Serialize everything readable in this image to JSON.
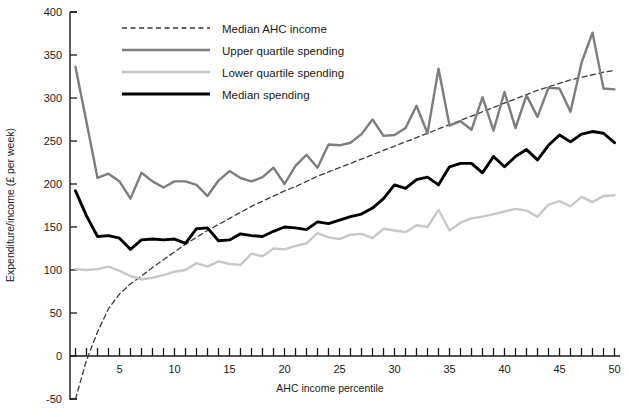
{
  "chart_data": {
    "type": "line",
    "title": "",
    "xlabel": "AHC income percentile",
    "ylabel": "Expenditure/income (£ per week)",
    "xlim": [
      0.5,
      50.5
    ],
    "ylim": [
      -50,
      400
    ],
    "xticks": [
      5,
      10,
      15,
      20,
      25,
      30,
      35,
      40,
      45,
      50
    ],
    "yticks": [
      -50,
      0,
      50,
      100,
      150,
      200,
      250,
      300,
      350,
      400
    ],
    "xtick_labels": [
      "5",
      "10",
      "15",
      "20",
      "25",
      "30",
      "35",
      "40",
      "45",
      "50"
    ],
    "ytick_labels": [
      "-50",
      "0",
      "50",
      "100",
      "150",
      "200",
      "250",
      "300",
      "350",
      "400"
    ],
    "grid": false,
    "legend_position": "top-center",
    "x": [
      1,
      2,
      3,
      4,
      5,
      6,
      7,
      8,
      9,
      10,
      11,
      12,
      13,
      14,
      15,
      16,
      17,
      18,
      19,
      20,
      21,
      22,
      23,
      24,
      25,
      26,
      27,
      28,
      29,
      30,
      31,
      32,
      33,
      34,
      35,
      36,
      37,
      38,
      39,
      40,
      41,
      42,
      43,
      44,
      45,
      46,
      47,
      48,
      49,
      50
    ],
    "series": [
      {
        "name": "Median AHC income",
        "color": "#3a3a3a",
        "style": "dashed",
        "width": 1.3,
        "values": [
          -50,
          -5,
          28,
          55,
          72,
          84,
          93,
          103,
          112,
          121,
          130,
          138,
          146,
          153,
          160,
          167,
          174,
          180,
          186,
          192,
          197,
          203,
          209,
          214,
          219,
          224,
          229,
          234,
          239,
          244,
          249,
          254,
          259,
          264,
          269,
          274,
          279,
          284,
          289,
          294,
          299,
          304,
          309,
          313,
          317,
          321,
          324,
          327,
          330,
          332
        ]
      },
      {
        "name": "Upper quartile spending",
        "color": "#7d7d7d",
        "style": "solid",
        "width": 2.4,
        "values": [
          336,
          272,
          207,
          212,
          203,
          183,
          213,
          203,
          196,
          203,
          203,
          199,
          186,
          204,
          215,
          207,
          203,
          208,
          219,
          200,
          221,
          234,
          219,
          246,
          245,
          248,
          258,
          275,
          256,
          257,
          265,
          291,
          259,
          334,
          268,
          273,
          263,
          301,
          262,
          307,
          265,
          303,
          278,
          312,
          311,
          284,
          341,
          376,
          311,
          310
        ]
      },
      {
        "name": "Lower quartile spending",
        "color": "#c8c8c8",
        "style": "solid",
        "width": 2.4,
        "values": [
          101,
          100,
          101,
          104,
          99,
          93,
          89,
          91,
          94,
          98,
          100,
          108,
          104,
          110,
          107,
          106,
          119,
          116,
          125,
          124,
          128,
          131,
          143,
          138,
          136,
          141,
          142,
          137,
          148,
          146,
          144,
          152,
          150,
          170,
          146,
          155,
          160,
          162,
          165,
          168,
          171,
          169,
          162,
          176,
          180,
          174,
          185,
          179,
          186,
          187
        ]
      },
      {
        "name": "Median spending",
        "color": "#000000",
        "style": "solid",
        "width": 2.9,
        "values": [
          192,
          163,
          139,
          140,
          137,
          124,
          135,
          136,
          135,
          136,
          131,
          148,
          149,
          134,
          135,
          142,
          140,
          139,
          145,
          150,
          149,
          147,
          156,
          154,
          158,
          162,
          165,
          172,
          183,
          199,
          195,
          205,
          208,
          199,
          220,
          224,
          224,
          213,
          232,
          220,
          232,
          240,
          228,
          245,
          257,
          249,
          258,
          261,
          259,
          248
        ]
      }
    ]
  },
  "legend": {
    "items": [
      {
        "label": "Median AHC income",
        "key": "median-ahc-income"
      },
      {
        "label": "Upper quartile spending",
        "key": "upper-quartile-spending"
      },
      {
        "label": "Lower quartile spending",
        "key": "lower-quartile-spending"
      },
      {
        "label": "Median spending",
        "key": "median-spending"
      }
    ]
  },
  "colors": {
    "median_ahc_income": "#3a3a3a",
    "upper_quartile": "#7d7d7d",
    "lower_quartile": "#c8c8c8",
    "median_spending": "#000000",
    "axis": "#1a1a1a",
    "background": "#ffffff"
  }
}
